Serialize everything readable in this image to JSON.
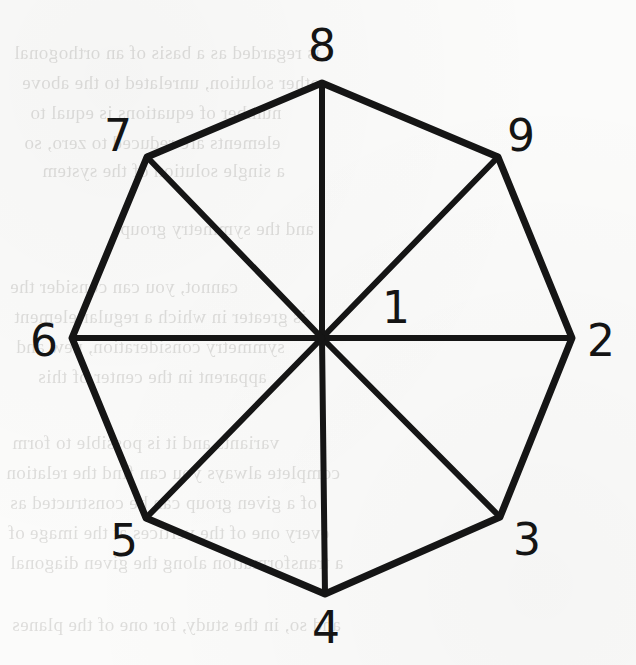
{
  "figure": {
    "shape": "octagon",
    "stroke_color": "#151515",
    "background_color": "#fbfbfa",
    "center": {
      "x": 322,
      "y": 338
    },
    "circumradius": 255,
    "vertices": [
      {
        "label": "8",
        "vx": 322,
        "vy": 83,
        "lx": 322,
        "ly": 46
      },
      {
        "label": "9",
        "vx": 498,
        "vy": 157,
        "lx": 521,
        "ly": 136
      },
      {
        "label": "2",
        "vx": 572,
        "vy": 338,
        "lx": 601,
        "ly": 341
      },
      {
        "label": "3",
        "vx": 500,
        "vy": 517,
        "lx": 527,
        "ly": 540
      },
      {
        "label": "4",
        "vx": 325,
        "vy": 594,
        "lx": 326,
        "ly": 628
      },
      {
        "label": "5",
        "vx": 146,
        "vy": 518,
        "lx": 124,
        "ly": 541
      },
      {
        "label": "6",
        "vx": 72,
        "vy": 338,
        "lx": 44,
        "ly": 341
      },
      {
        "label": "7",
        "vx": 147,
        "vy": 157,
        "lx": 118,
        "ly": 136
      }
    ],
    "interior_labels": [
      {
        "label": "1",
        "lx": 396,
        "ly": 308
      }
    ],
    "edge_stroke_width": 7,
    "spoke_stroke_width": 6
  },
  "bleed_text": {
    "note": "faint mirrored show-through text from the reverse page",
    "lines": [
      {
        "text": "is regarded as a basis of an orthogonal",
        "x": 14,
        "y": 42
      },
      {
        "text": "other solution, unrelated to the above",
        "x": 22,
        "y": 72
      },
      {
        "text": "number of equations is equal to",
        "x": 30,
        "y": 102
      },
      {
        "text": "elements are reduced to zero, so",
        "x": 24,
        "y": 132
      },
      {
        "text": "a single solution of the system",
        "x": 42,
        "y": 160
      },
      {
        "text": "and the symmetry group",
        "x": 120,
        "y": 218
      },
      {
        "text": "cannot, you can consider the",
        "x": 10,
        "y": 276
      },
      {
        "text": "is greater in which a regular element",
        "x": 14,
        "y": 306
      },
      {
        "text": "symmetry consideration, new and",
        "x": 16,
        "y": 336
      },
      {
        "text": "apparent in the center of this",
        "x": 38,
        "y": 366
      },
      {
        "text": "variants and it is possible to form",
        "x": 12,
        "y": 432
      },
      {
        "text": "complete always you can find the relation",
        "x": 6,
        "y": 462
      },
      {
        "text": "of a given group can be constructed as",
        "x": 10,
        "y": 492
      },
      {
        "text": "every one of the vertices at the image of",
        "x": 8,
        "y": 522
      },
      {
        "text": "a transformation along the given diagonal",
        "x": 10,
        "y": 552
      },
      {
        "text": "and so, in the study, for one of the planes",
        "x": 12,
        "y": 614
      }
    ]
  }
}
